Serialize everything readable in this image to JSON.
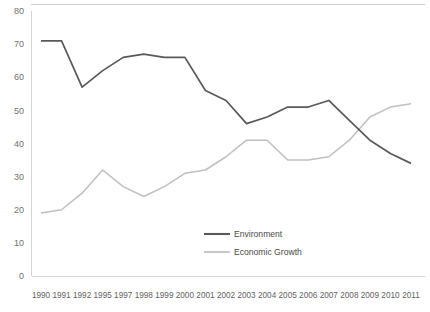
{
  "chart_data": {
    "type": "line",
    "title": "",
    "subtitle": "",
    "xlabel": "",
    "ylabel": "",
    "ylim": [
      0,
      80
    ],
    "ytick_labels": [
      "0",
      "10",
      "20",
      "30",
      "40",
      "50",
      "60",
      "70",
      "80"
    ],
    "ytick_values": [
      0,
      10,
      20,
      30,
      40,
      50,
      60,
      70,
      80
    ],
    "grid": false,
    "legend_position": "inside-bottom-center",
    "categories": [
      "1990",
      "1991",
      "1992",
      "1995",
      "1997",
      "1998",
      "1999",
      "2000",
      "2001",
      "2002",
      "2003",
      "2004",
      "2005",
      "2006",
      "2007",
      "2008",
      "2009",
      "2010",
      "2011"
    ],
    "series": [
      {
        "name": "Environment",
        "color": "#595959",
        "values": [
          71,
          71,
          57,
          62,
          66,
          67,
          66,
          66,
          56,
          53,
          46,
          48,
          51,
          51,
          53,
          47,
          41,
          37,
          34
        ]
      },
      {
        "name": "Economic Growth",
        "color": "#bfbfbf",
        "values": [
          19,
          20,
          25,
          32,
          27,
          24,
          27,
          31,
          32,
          36,
          41,
          41,
          35,
          35,
          36,
          41,
          48,
          51,
          52
        ]
      }
    ]
  },
  "legend": {
    "items": [
      {
        "label": "Environment",
        "color": "#595959"
      },
      {
        "label": "Economic Growth",
        "color": "#bfbfbf"
      }
    ]
  },
  "axes": {
    "y_axis_color": "#d4d4d4",
    "x_axis_color": "#d4d4d4"
  }
}
